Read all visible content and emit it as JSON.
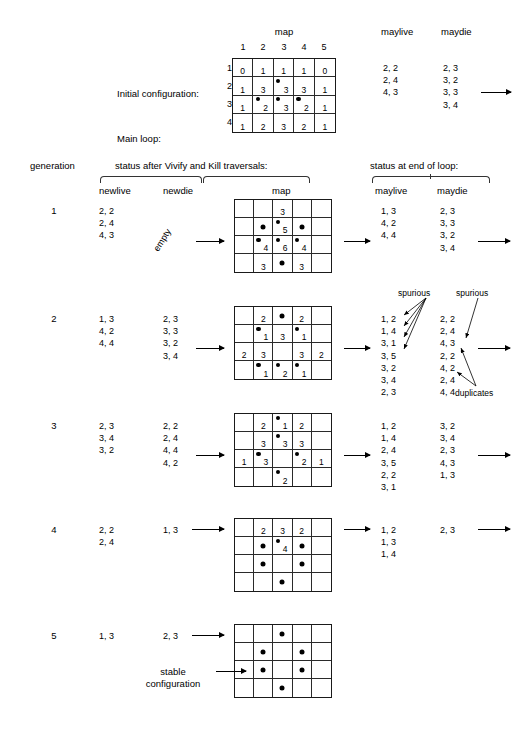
{
  "labels": {
    "initial_configuration": "Initial configuration:",
    "main_loop": "Main loop:",
    "generation": "generation",
    "status_after": "status after Vivify and Kill traversals:",
    "status_end": "status at end of loop:",
    "newlive": "newlive",
    "newdie": "newdie",
    "map": "map",
    "maylive": "maylive",
    "maydie": "maydie",
    "empty": "empty",
    "spurious_left": "spurious",
    "spurious_right": "spurious",
    "duplicates": "duplicates",
    "stable_configuration_l1": "stable",
    "stable_configuration_l2": "configuration"
  },
  "initial": {
    "col_headers": [
      "1",
      "2",
      "3",
      "4",
      "5"
    ],
    "row_headers": [
      "1",
      "2",
      "3",
      "4"
    ],
    "maylive": "2, 2\n2, 4\n4, 3",
    "maydie": "2, 3\n3, 2\n3, 3\n3, 4",
    "cells": [
      [
        {
          "n": "0",
          "d": false
        },
        {
          "n": "1",
          "d": false
        },
        {
          "n": "1",
          "d": false
        },
        {
          "n": "1",
          "d": false
        },
        {
          "n": "0",
          "d": false
        }
      ],
      [
        {
          "n": "1",
          "d": false
        },
        {
          "n": "3",
          "d": false
        },
        {
          "n": "3",
          "d": true
        },
        {
          "n": "3",
          "d": false
        },
        {
          "n": "1",
          "d": false
        }
      ],
      [
        {
          "n": "1",
          "d": false
        },
        {
          "n": "2",
          "d": true
        },
        {
          "n": "3",
          "d": true
        },
        {
          "n": "2",
          "d": true
        },
        {
          "n": "1",
          "d": false
        }
      ],
      [
        {
          "n": "1",
          "d": false
        },
        {
          "n": "2",
          "d": false
        },
        {
          "n": "3",
          "d": false
        },
        {
          "n": "2",
          "d": false
        },
        {
          "n": "1",
          "d": false
        }
      ]
    ]
  },
  "generations": [
    {
      "number": "1",
      "newlive": "2, 2\n2, 4\n4, 3",
      "newdie": "",
      "newdie_empty": true,
      "maylive": "1, 3\n4, 2\n4, 4",
      "maydie": "2, 3\n3, 3\n3, 2\n3, 4",
      "cells": [
        [
          {
            "n": "",
            "d": false
          },
          {
            "n": "",
            "d": false
          },
          {
            "n": "3",
            "d": false
          },
          {
            "n": "",
            "d": false
          },
          {
            "n": "",
            "d": false
          }
        ],
        [
          {
            "n": "",
            "d": false
          },
          {
            "n": "",
            "d": true,
            "dc": true
          },
          {
            "n": "5",
            "d": true
          },
          {
            "n": "",
            "d": true,
            "dc": true
          },
          {
            "n": "",
            "d": false
          }
        ],
        [
          {
            "n": "",
            "d": false
          },
          {
            "n": "4",
            "d": true
          },
          {
            "n": "6",
            "d": true
          },
          {
            "n": "4",
            "d": true
          },
          {
            "n": "",
            "d": false
          }
        ],
        [
          {
            "n": "",
            "d": false
          },
          {
            "n": "3",
            "d": false
          },
          {
            "n": "",
            "d": true,
            "dc": true
          },
          {
            "n": "3",
            "d": false
          },
          {
            "n": "",
            "d": false
          }
        ]
      ]
    },
    {
      "number": "2",
      "newlive": "1, 3\n4, 2\n4, 4",
      "newdie": "2, 3\n3, 3\n3, 2\n3, 4",
      "newdie_empty": false,
      "maylive": "1, 2\n1, 4\n3, 1\n3, 5\n3, 2\n3, 4\n2, 3",
      "maydie": "2, 2\n2, 4\n4, 3\n2, 2\n4, 2\n2, 4\n4, 4",
      "cells": [
        [
          {
            "n": "",
            "d": false
          },
          {
            "n": "2",
            "d": false
          },
          {
            "n": "",
            "d": true,
            "dc": true
          },
          {
            "n": "2",
            "d": false
          },
          {
            "n": "",
            "d": false
          }
        ],
        [
          {
            "n": "",
            "d": false
          },
          {
            "n": "1",
            "d": true
          },
          {
            "n": "3",
            "d": false
          },
          {
            "n": "1",
            "d": true
          },
          {
            "n": "",
            "d": false
          }
        ],
        [
          {
            "n": "2",
            "d": false
          },
          {
            "n": "3",
            "d": false
          },
          {
            "n": "",
            "d": false
          },
          {
            "n": "3",
            "d": false
          },
          {
            "n": "2",
            "d": false
          }
        ],
        [
          {
            "n": "",
            "d": false
          },
          {
            "n": "1",
            "d": true
          },
          {
            "n": "2",
            "d": true
          },
          {
            "n": "1",
            "d": true
          },
          {
            "n": "",
            "d": false
          }
        ]
      ]
    },
    {
      "number": "3",
      "newlive": "2, 3\n3, 4\n3, 2",
      "newdie": "2, 2\n2, 4\n4, 4\n4, 2",
      "newdie_empty": false,
      "maylive": "1, 2\n1, 4\n2, 4\n3, 5\n2, 2\n3, 1",
      "maydie": "3, 2\n3, 4\n2, 3\n4, 3\n1, 3",
      "cells": [
        [
          {
            "n": "",
            "d": false
          },
          {
            "n": "2",
            "d": false
          },
          {
            "n": "1",
            "d": true
          },
          {
            "n": "2",
            "d": false
          },
          {
            "n": "",
            "d": false
          }
        ],
        [
          {
            "n": "",
            "d": false
          },
          {
            "n": "3",
            "d": false
          },
          {
            "n": "3",
            "d": true
          },
          {
            "n": "3",
            "d": false
          },
          {
            "n": "",
            "d": false
          }
        ],
        [
          {
            "n": "1",
            "d": false
          },
          {
            "n": "3",
            "d": true
          },
          {
            "n": "",
            "d": false
          },
          {
            "n": "2",
            "d": true
          },
          {
            "n": "1",
            "d": false
          }
        ],
        [
          {
            "n": "",
            "d": false
          },
          {
            "n": "",
            "d": false
          },
          {
            "n": "2",
            "d": true
          },
          {
            "n": "",
            "d": false
          },
          {
            "n": "",
            "d": false
          }
        ]
      ]
    },
    {
      "number": "4",
      "newlive": "2, 2\n2, 4",
      "newdie": "1, 3",
      "newdie_empty": false,
      "maylive": "1, 2\n1, 3\n1, 4",
      "maydie": "2, 3",
      "cells": [
        [
          {
            "n": "",
            "d": false
          },
          {
            "n": "2",
            "d": false
          },
          {
            "n": "3",
            "d": false
          },
          {
            "n": "2",
            "d": false
          },
          {
            "n": "",
            "d": false
          }
        ],
        [
          {
            "n": "",
            "d": false
          },
          {
            "n": "",
            "d": true,
            "dc": true
          },
          {
            "n": "4",
            "d": true
          },
          {
            "n": "",
            "d": true,
            "dc": true
          },
          {
            "n": "",
            "d": false
          }
        ],
        [
          {
            "n": "",
            "d": false
          },
          {
            "n": "",
            "d": true,
            "dc": true
          },
          {
            "n": "",
            "d": false
          },
          {
            "n": "",
            "d": true,
            "dc": true
          },
          {
            "n": "",
            "d": false
          }
        ],
        [
          {
            "n": "",
            "d": false
          },
          {
            "n": "",
            "d": false
          },
          {
            "n": "",
            "d": true,
            "dc": true
          },
          {
            "n": "",
            "d": false
          },
          {
            "n": "",
            "d": false
          }
        ]
      ]
    },
    {
      "number": "5",
      "newlive": "1, 3",
      "newdie": "2, 3",
      "newdie_empty": false,
      "maylive": "",
      "maydie": "",
      "cells": [
        [
          {
            "n": "",
            "d": false
          },
          {
            "n": "",
            "d": false
          },
          {
            "n": "",
            "d": true,
            "dc": true
          },
          {
            "n": "",
            "d": false
          },
          {
            "n": "",
            "d": false
          }
        ],
        [
          {
            "n": "",
            "d": false
          },
          {
            "n": "",
            "d": true,
            "dc": true
          },
          {
            "n": "",
            "d": false
          },
          {
            "n": "",
            "d": true,
            "dc": true
          },
          {
            "n": "",
            "d": false
          }
        ],
        [
          {
            "n": "",
            "d": false
          },
          {
            "n": "",
            "d": true,
            "dc": true
          },
          {
            "n": "",
            "d": false
          },
          {
            "n": "",
            "d": true,
            "dc": true
          },
          {
            "n": "",
            "d": false
          }
        ],
        [
          {
            "n": "",
            "d": false
          },
          {
            "n": "",
            "d": false
          },
          {
            "n": "",
            "d": true,
            "dc": true
          },
          {
            "n": "",
            "d": false
          },
          {
            "n": "",
            "d": false
          }
        ]
      ]
    }
  ]
}
